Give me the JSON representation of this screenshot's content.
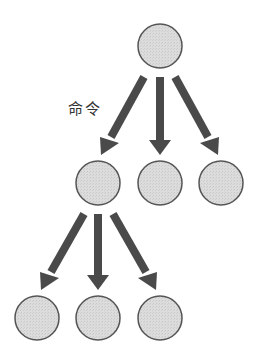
{
  "diagram": {
    "type": "hierarchy-tree",
    "label": "命令",
    "colors": {
      "node_fill": "#d9d9d9",
      "node_stroke": "#555555",
      "arrow": "#4a4a4a",
      "background": "#ffffff"
    },
    "nodes": [
      {
        "id": "root",
        "cx": 160,
        "cy": 46,
        "r": 22
      },
      {
        "id": "m1",
        "cx": 98,
        "cy": 183,
        "r": 22
      },
      {
        "id": "m2",
        "cx": 160,
        "cy": 183,
        "r": 22
      },
      {
        "id": "m3",
        "cx": 221,
        "cy": 183,
        "r": 22
      },
      {
        "id": "b1",
        "cx": 37,
        "cy": 318,
        "r": 22
      },
      {
        "id": "b2",
        "cx": 98,
        "cy": 318,
        "r": 22
      },
      {
        "id": "b3",
        "cx": 160,
        "cy": 318,
        "r": 22
      }
    ],
    "edges": [
      {
        "from": "root",
        "to": "m1"
      },
      {
        "from": "root",
        "to": "m2"
      },
      {
        "from": "root",
        "to": "m3"
      },
      {
        "from": "m1",
        "to": "b1"
      },
      {
        "from": "m1",
        "to": "b2"
      },
      {
        "from": "m1",
        "to": "b3"
      }
    ]
  }
}
